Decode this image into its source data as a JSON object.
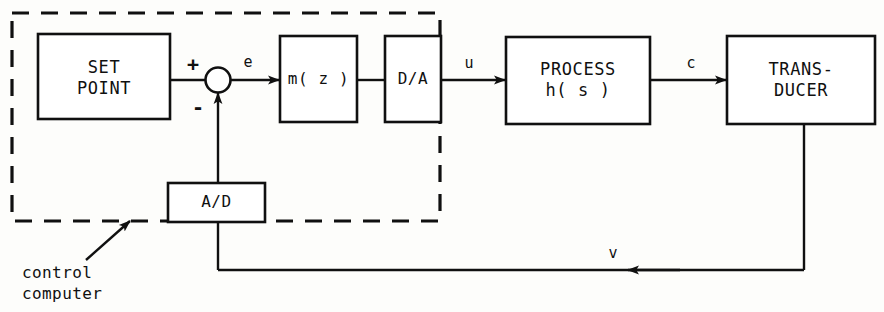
{
  "diagram": {
    "type": "block-diagram",
    "colors": {
      "ink": "#101010",
      "paper": "#fdfdfb"
    },
    "blocks": {
      "set_point": "SET\nPOINT",
      "controller": "m( z )",
      "dac": "D/A",
      "process": "PROCESS\nh( s )",
      "transducer": "TRANS-\nDUCER",
      "adc": "A/D"
    },
    "signals": {
      "error": "e",
      "control": "u",
      "output": "c",
      "feedback": "v"
    },
    "summing_junction": {
      "plus": "+",
      "minus": "-"
    },
    "annotation": {
      "boundary_note": "control\ncomputer"
    }
  }
}
